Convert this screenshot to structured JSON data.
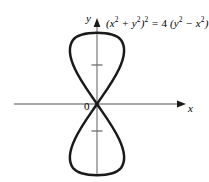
{
  "figure": {
    "background_color": "#ffffff",
    "curve_color": "#1a1a1a",
    "axis_color": "#8c8c8c",
    "text_color": "#000000"
  },
  "equation": {
    "full_text": "(x^2 + y^2)^2 = 4 (y^2 - x^2)",
    "parts": {
      "open_paren": "(",
      "x_var": "x",
      "exp_2_a": "2",
      "plus": " + ",
      "y_var": "y",
      "exp_2_b": "2",
      "close_paren": ")",
      "exp_2_outer": "2",
      "equals": " = ",
      "coefficient": "4 ",
      "open_paren_2": "(",
      "y_var_2": "y",
      "exp_2_c": "2",
      "minus": " − ",
      "x_var_2": "x",
      "exp_2_d": "2",
      "close_paren_2": ")"
    }
  },
  "axes": {
    "y_label": "y",
    "x_label": "x",
    "origin_label": "0",
    "x_axis": {
      "y_px": 104,
      "x_start_px": 14,
      "x_end_px": 186,
      "arrow": "right"
    },
    "y_axis": {
      "x_px": 97,
      "y_start_px": 18,
      "y_end_px": 176,
      "arrow": "up"
    },
    "ticks": [
      {
        "axis": "y",
        "y_px": 65,
        "label": ""
      },
      {
        "axis": "y",
        "y_px": 131,
        "label": ""
      }
    ]
  },
  "chart_data": {
    "type": "line",
    "xlabel": "x",
    "ylabel": "y",
    "grid": false,
    "legend": null,
    "curve_name": "lemniscate-vertical",
    "polar_form": "r² = 4 cos(2θ) rotated to vertical axis; r = 2√(−cos 2θ)",
    "origin_px": {
      "x": 97,
      "y": 104
    },
    "scale_px_per_unit": 34.5,
    "xlim": [
      -2.4,
      2.6
    ],
    "ylim": [
      -2.1,
      2.5
    ],
    "extents_px": {
      "top": 33,
      "bottom": 169,
      "left_top_loop": 64,
      "right_top_loop": 126,
      "left_bottom_loop": 64,
      "right_bottom_loop": 126
    },
    "extents_units": {
      "y_max": 2.0,
      "y_min": -2.0,
      "x_max_of_loop": 0.84,
      "x_min_of_loop": -0.84
    },
    "points_upper_loop": [
      [
        0.0,
        0.0
      ],
      [
        0.28,
        0.42
      ],
      [
        0.5,
        0.8
      ],
      [
        0.68,
        1.14
      ],
      [
        0.79,
        1.43
      ],
      [
        0.84,
        1.66
      ],
      [
        0.8,
        1.83
      ],
      [
        0.68,
        1.94
      ],
      [
        0.48,
        1.99
      ],
      [
        0.24,
        2.0
      ],
      [
        0.0,
        2.0
      ],
      [
        -0.24,
        2.0
      ],
      [
        -0.48,
        1.99
      ],
      [
        -0.68,
        1.94
      ],
      [
        -0.8,
        1.83
      ],
      [
        -0.84,
        1.66
      ],
      [
        -0.79,
        1.43
      ],
      [
        -0.68,
        1.14
      ],
      [
        -0.5,
        0.8
      ],
      [
        -0.28,
        0.42
      ],
      [
        0.0,
        0.0
      ]
    ],
    "points_lower_loop": [
      [
        0.0,
        0.0
      ],
      [
        0.28,
        -0.42
      ],
      [
        0.5,
        -0.8
      ],
      [
        0.68,
        -1.14
      ],
      [
        0.79,
        -1.43
      ],
      [
        0.84,
        -1.66
      ],
      [
        0.8,
        -1.83
      ],
      [
        0.68,
        -1.94
      ],
      [
        0.48,
        -1.99
      ],
      [
        0.24,
        -2.0
      ],
      [
        0.0,
        -2.0
      ],
      [
        -0.24,
        -2.0
      ],
      [
        -0.48,
        -1.99
      ],
      [
        -0.68,
        -1.94
      ],
      [
        -0.8,
        -1.83
      ],
      [
        -0.84,
        -1.66
      ],
      [
        -0.79,
        -1.43
      ],
      [
        -0.68,
        -1.14
      ],
      [
        -0.5,
        -0.8
      ],
      [
        -0.28,
        -0.42
      ],
      [
        0.0,
        0.0
      ]
    ]
  }
}
